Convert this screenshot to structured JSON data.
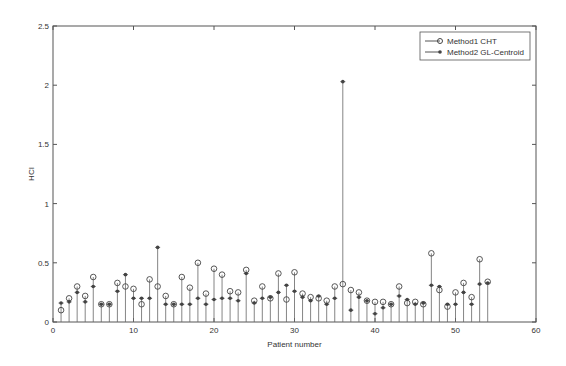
{
  "chart_data": {
    "type": "stem",
    "title": "",
    "xlabel": "Patient number",
    "ylabel": "HCI",
    "xlim": [
      0,
      60
    ],
    "ylim": [
      0,
      2.5
    ],
    "xticks": [
      0,
      10,
      20,
      30,
      40,
      50,
      60
    ],
    "yticks": [
      0,
      0.5,
      1,
      1.5,
      2,
      2.5
    ],
    "grid": false,
    "legend_position": "top-right",
    "x": [
      1,
      2,
      3,
      4,
      5,
      6,
      7,
      8,
      9,
      10,
      11,
      12,
      13,
      14,
      15,
      16,
      17,
      18,
      19,
      20,
      21,
      22,
      23,
      24,
      25,
      26,
      27,
      28,
      29,
      30,
      31,
      32,
      33,
      34,
      35,
      36,
      37,
      38,
      39,
      40,
      41,
      42,
      43,
      44,
      45,
      46,
      47,
      48,
      49,
      50,
      51,
      52,
      53,
      54
    ],
    "series": [
      {
        "name": "Method1 CHT",
        "marker": "circle",
        "values": [
          0.1,
          0.2,
          0.3,
          0.22,
          0.38,
          0.15,
          0.15,
          0.33,
          0.3,
          0.28,
          0.15,
          0.36,
          0.3,
          0.22,
          0.15,
          0.38,
          0.29,
          0.5,
          0.24,
          0.45,
          0.4,
          0.26,
          0.25,
          0.44,
          0.18,
          0.3,
          0.2,
          0.41,
          0.19,
          0.42,
          0.24,
          0.21,
          0.2,
          0.18,
          0.3,
          0.32,
          0.27,
          0.25,
          0.18,
          0.17,
          0.17,
          0.15,
          0.3,
          0.16,
          0.17,
          0.15,
          0.58,
          0.27,
          0.13,
          0.25,
          0.33,
          0.21,
          0.53,
          0.34
        ]
      },
      {
        "name": "Method2 GL-Centroid",
        "marker": "asterisk",
        "values": [
          0.16,
          0.17,
          0.25,
          0.17,
          0.3,
          0.15,
          0.15,
          0.26,
          0.4,
          0.2,
          0.2,
          0.2,
          0.63,
          0.15,
          0.15,
          0.15,
          0.15,
          0.2,
          0.15,
          0.19,
          0.2,
          0.2,
          0.18,
          0.41,
          0.16,
          0.2,
          0.21,
          0.25,
          0.31,
          0.26,
          0.21,
          0.18,
          0.22,
          0.15,
          0.2,
          2.03,
          0.1,
          0.21,
          0.18,
          0.07,
          0.12,
          0.15,
          0.22,
          0.19,
          0.15,
          0.16,
          0.31,
          0.3,
          0.15,
          0.15,
          0.25,
          0.15,
          0.32,
          0.33
        ]
      }
    ]
  }
}
